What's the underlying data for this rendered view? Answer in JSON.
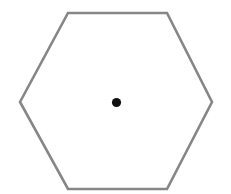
{
  "figure": {
    "canvas": {
      "width": 231,
      "height": 194,
      "background_color": "#ffffff"
    },
    "shapes": [
      {
        "name": "hexagon",
        "type": "polygon",
        "sides": 6,
        "orientation": "flat-top",
        "points": "20,102 68,13 167,13 212,102 167,189 68,189",
        "vertices": [
          {
            "label": "left",
            "x": 20,
            "y": 102
          },
          {
            "label": "top-left",
            "x": 68,
            "y": 13
          },
          {
            "label": "top-right",
            "x": 167,
            "y": 13
          },
          {
            "label": "right",
            "x": 212,
            "y": 102
          },
          {
            "label": "bottom-right",
            "x": 167,
            "y": 189
          },
          {
            "label": "bottom-left",
            "x": 68,
            "y": 189
          }
        ],
        "stroke_color": "#868686",
        "stroke_width": 2.6,
        "fill_color": "#ffffff"
      },
      {
        "name": "center-point",
        "type": "circle",
        "cx": 116.5,
        "cy": 102.5,
        "r": 4.6,
        "fill_color": "#111111"
      }
    ]
  }
}
